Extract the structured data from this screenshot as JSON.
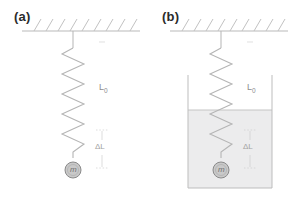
{
  "figure": {
    "width": 296,
    "height": 198,
    "background": "#ffffff",
    "type": "physics-diagram"
  },
  "panels": [
    {
      "key": "a",
      "label": "(a)",
      "ceiling": {
        "support_line_color": "#b9b9b9",
        "hatch_color": "#c2c2c2",
        "hatch_count": 9
      },
      "spring": {
        "color": "#b5b5b5",
        "coils": 11,
        "top_y": 34,
        "bottom_y": 163
      },
      "mass": {
        "label": "m",
        "fill": "#c9c9c9",
        "stroke": "#8a8a8a",
        "radius": 8
      },
      "natural_length": {
        "label": "L",
        "subscript": "0",
        "color": "#8d8d8d"
      },
      "extension": {
        "label": "ΔL",
        "color": "#a2a2a2"
      },
      "liquid": null
    },
    {
      "key": "b",
      "label": "(b)",
      "ceiling": {
        "support_line_color": "#b9b9b9",
        "hatch_color": "#c2c2c2",
        "hatch_count": 9
      },
      "spring": {
        "color": "#b5b5b5",
        "coils": 11,
        "top_y": 34,
        "bottom_y": 163
      },
      "mass": {
        "label": "m",
        "fill": "#c9c9c9",
        "stroke": "#8a8a8a",
        "radius": 8
      },
      "natural_length": {
        "label": "L",
        "subscript": "0",
        "color": "#8d8d8d"
      },
      "extension": {
        "label": "ΔL",
        "color": "#a2a2a2"
      },
      "liquid": {
        "container_stroke": "#bdbdbd",
        "fill": "#ececed",
        "surface_color": "#c4c4c4",
        "surface_y": 110,
        "container_top_y": 75,
        "container_bottom_y": 188
      }
    }
  ]
}
